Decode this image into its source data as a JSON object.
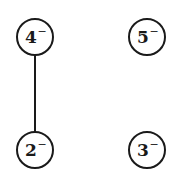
{
  "diagram": {
    "type": "graph",
    "nodes": [
      {
        "id": "4",
        "label": "4",
        "superscript": "−"
      },
      {
        "id": "5",
        "label": "5",
        "superscript": "−"
      },
      {
        "id": "2",
        "label": "2",
        "superscript": "−"
      },
      {
        "id": "3",
        "label": "3",
        "superscript": "−"
      }
    ],
    "edges": [
      {
        "from": "4",
        "to": "2"
      }
    ]
  }
}
